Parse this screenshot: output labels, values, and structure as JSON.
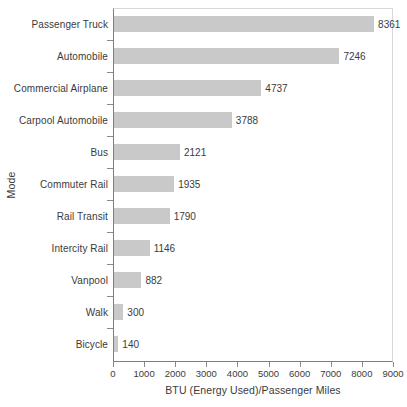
{
  "chart_data": {
    "type": "bar",
    "orientation": "horizontal",
    "title": "",
    "xlabel": "BTU (Energy Used)/Passenger Miles",
    "ylabel": "Mode",
    "xlim": [
      0,
      9000
    ],
    "xticks": [
      0,
      1000,
      2000,
      3000,
      4000,
      5000,
      6000,
      7000,
      8000,
      9000
    ],
    "xtick_labels": [
      "0",
      "1000",
      "2000",
      "3000",
      "4000",
      "5000",
      "6000",
      "7000",
      "8000",
      "9000"
    ],
    "grid": false,
    "legend": null,
    "bar_color": "#c9c9c9",
    "categories": [
      "Passenger Truck",
      "Automobile",
      "Commercial Airplane",
      "Carpool Automobile",
      "Bus",
      "Commuter Rail",
      "Rail Transit",
      "Intercity Rail",
      "Vanpool",
      "Walk",
      "Bicycle"
    ],
    "values": [
      8361,
      7246,
      4737,
      3788,
      2121,
      1935,
      1790,
      1146,
      882,
      300,
      140
    ],
    "value_labels": [
      "8361",
      "7246",
      "4737",
      "3788",
      "2121",
      "1935",
      "1790",
      "1146",
      "882",
      "300",
      "140"
    ]
  }
}
